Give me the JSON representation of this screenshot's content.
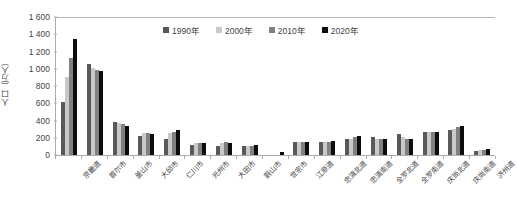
{
  "chart_data": {
    "type": "bar",
    "title": "",
    "subtitle": "",
    "xlabel": "",
    "ylabel": "人口（万人）",
    "ylim": [
      0,
      1600
    ],
    "y_ticks": [
      0,
      200,
      400,
      600,
      800,
      1000,
      1200,
      1400,
      1600
    ],
    "y_tick_labels": [
      "0",
      "200",
      "400",
      "600",
      "800",
      "1 000",
      "1 200",
      "1 400",
      "1 600"
    ],
    "grid": false,
    "legend_position": "top-center",
    "categories": [
      "京畿道",
      "首尔市",
      "釜山市",
      "大邱市",
      "仁川市",
      "光州市",
      "大田市",
      "蔚山市",
      "世宗市",
      "江原道",
      "忠清北道",
      "忠清南道",
      "全罗北道",
      "全罗南道",
      "庆尚北道",
      "庆尚南道",
      "济州道"
    ],
    "series": [
      {
        "name": "1990年",
        "color": "#595959",
        "values": [
          615,
          1060,
          380,
          225,
          180,
          115,
          105,
          100,
          0,
          150,
          150,
          180,
          205,
          245,
          265,
          295,
          50
        ]
      },
      {
        "name": "2000年",
        "color": "#c9c9c9",
        "values": [
          900,
          1010,
          375,
          250,
          250,
          135,
          135,
          105,
          0,
          150,
          150,
          185,
          190,
          210,
          265,
          300,
          55
        ]
      },
      {
        "name": "2010年",
        "color": "#808080",
        "values": [
          1125,
          980,
          355,
          250,
          265,
          145,
          150,
          110,
          0,
          150,
          155,
          205,
          180,
          190,
          265,
          325,
          55
        ]
      },
      {
        "name": "2020年",
        "color": "#0d0d0d",
        "values": [
          1340,
          970,
          340,
          240,
          295,
          145,
          145,
          115,
          35,
          150,
          160,
          215,
          180,
          185,
          265,
          335,
          67
        ]
      }
    ]
  },
  "legend": {
    "items": [
      {
        "label": "1990年"
      },
      {
        "label": "2000年"
      },
      {
        "label": "2010年"
      },
      {
        "label": "2020年"
      }
    ]
  }
}
